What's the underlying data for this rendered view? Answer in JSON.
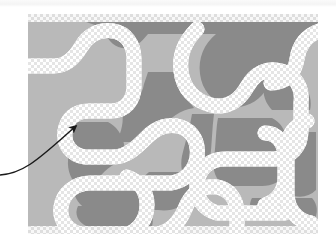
{
  "figure": {
    "kind": "segmentation-mask-illustration",
    "canvas": {
      "left": 28,
      "top": 14,
      "width": 290,
      "height": 220
    },
    "colors": {
      "page_background": "#ffffff",
      "light_gray_region": "#b9b9b9",
      "dark_gray_region": "#8a8a8a",
      "channel_white": "#ffffff",
      "checker_light": "#ffffff",
      "checker_dark": "#e3e3e3",
      "annotation_stroke": "#1a1a1a",
      "banner_tint": "#f4f4f4"
    },
    "checker": {
      "cell_size_px": 3
    }
  },
  "annotation": {
    "arrow": {
      "label": "callout-arrow",
      "tail_x": 0,
      "tail_y": 175,
      "tip_x": 78,
      "tip_y": 123,
      "stroke_width": 1.4,
      "head_size": 8
    }
  },
  "regions": {
    "channel_stroke_width": 13,
    "channel_paths": [
      "M 0 52 L 26 52 C 38 52 46 44 52 34 C 58 22 70 16 84 18 C 96 20 104 30 104 44 L 104 72 C 104 86 96 96 82 96 L 60 96 C 46 96 38 104 36 116 C 34 128 42 140 56 142 L 84 142 C 98 142 108 132 118 122 C 128 112 140 108 152 112 C 164 116 170 128 168 142 C 166 156 156 166 142 168 L 62 168 C 46 168 34 178 32 192 C 30 206 40 218 56 220",
      "M 120 220 C 140 220 150 208 156 194 C 162 178 174 170 188 172 C 200 174 208 184 208 198 L 208 220",
      "M 96 220 C 110 216 118 204 118 190 C 118 176 110 166 98 162",
      "M 168 16 C 156 28 150 42 152 58 C 154 76 166 88 182 92 C 198 96 210 88 218 74 C 226 60 238 54 252 58 C 266 62 274 74 272 90 L 272 116 C 272 132 262 142 246 144 L 196 144 C 180 144 170 154 168 168 C 166 182 174 194 188 198 L 256 198",
      "M 290 18 C 278 22 270 32 268 46 C 266 60 256 70 242 70",
      "M 236 118 C 248 118 256 128 256 142 L 256 162 C 256 176 248 186 236 190",
      "M 278 108 C 266 112 258 122 258 136 L 258 178 C 258 194 268 206 282 208"
    ]
  },
  "shapes": {
    "dark_regions": [
      "top-wide-plateau",
      "left-pocket",
      "mid-left-lobe",
      "center-spine",
      "right-hook",
      "lower-band",
      "bottom-left-blob"
    ]
  }
}
